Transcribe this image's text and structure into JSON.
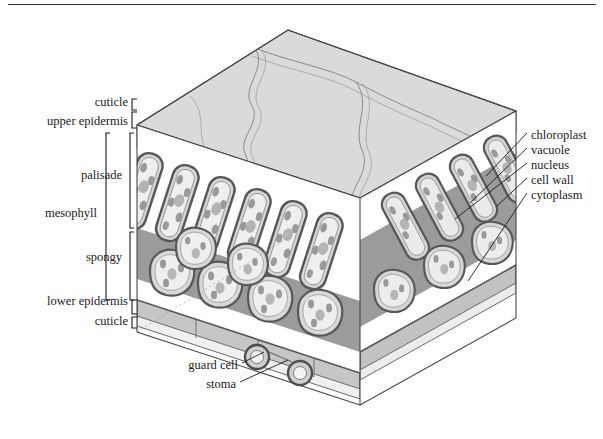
{
  "figure": {
    "type": "labelled-biological-diagram",
    "page_rule": true,
    "colors": {
      "ink": "#1b1b1b",
      "outline": "#555555",
      "cell_wall": "#6f6f6f",
      "top_surface": "#d9d9d9",
      "cuticle": "#e8e8e8",
      "epidermis": "#cfcfcf",
      "air_space": "#9a9a9a",
      "vacuole": "#ededed",
      "chloroplast": "#8d8d8d",
      "nucleus": "#a5a5a5",
      "background": "#ffffff"
    }
  },
  "labels_left": [
    {
      "id": "cuticle-upper",
      "text": "cuticle",
      "x": 128,
      "y": 103,
      "bracket": "small"
    },
    {
      "id": "upper-epidermis",
      "text": "upper epidermis",
      "x": 128,
      "y": 122,
      "bracket": "small"
    },
    {
      "id": "palisade",
      "text": "palisade",
      "x": 122,
      "y": 176,
      "bracket": "inner"
    },
    {
      "id": "mesophyll",
      "text": "mesophyll",
      "x": 97,
      "y": 214,
      "bracket": "outer"
    },
    {
      "id": "spongy",
      "text": "spongy",
      "x": 122,
      "y": 258,
      "bracket": "inner"
    },
    {
      "id": "lower-epidermis",
      "text": "lower epidermis",
      "x": 128,
      "y": 302,
      "bracket": "small"
    },
    {
      "id": "cuticle-lower",
      "text": "cuticle",
      "x": 128,
      "y": 322,
      "bracket": "small"
    }
  ],
  "labels_right": [
    {
      "id": "chloroplast",
      "text": "chloroplast",
      "x": 531,
      "y": 136
    },
    {
      "id": "vacuole",
      "text": "vacuole",
      "x": 531,
      "y": 151
    },
    {
      "id": "nucleus",
      "text": "nucleus",
      "x": 531,
      "y": 166
    },
    {
      "id": "cell-wall",
      "text": "cell wall",
      "x": 531,
      "y": 181
    },
    {
      "id": "cytoplasm",
      "text": "cytoplasm",
      "x": 531,
      "y": 196
    }
  ],
  "labels_bottom": [
    {
      "id": "guard-cell",
      "text": "guard cell",
      "x": 176,
      "y": 366
    },
    {
      "id": "stoma",
      "text": "stoma",
      "x": 200,
      "y": 385
    }
  ],
  "structure_notes": {
    "layers_top_to_bottom": [
      "cuticle",
      "upper epidermis",
      "palisade mesophyll",
      "spongy mesophyll",
      "lower epidermis",
      "cuticle"
    ],
    "palisade_cell_count": 9,
    "spongy_cell_count": 11,
    "stomata_count": 2
  }
}
